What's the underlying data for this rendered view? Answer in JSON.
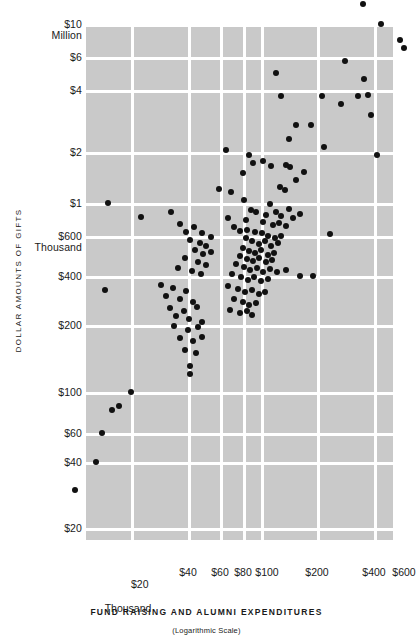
{
  "chart_data": {
    "type": "scatter",
    "title": "",
    "xlabel": "FUND RAISING AND ALUMNI EXPENDITURES",
    "ylabel": "DOLLAR AMOUNTS OF GIFTS",
    "scale_note": "(Logarithmic Scale)",
    "xscale": "log",
    "yscale": "log",
    "x_unit": "Thousand",
    "y_unit_top": "Million",
    "y_unit_mid": "Thousand",
    "xlim": [
      14000,
      650000
    ],
    "ylim": [
      16000,
      13000000
    ],
    "xticks": [
      {
        "value": 20000,
        "label": "$20"
      },
      {
        "value": 40000,
        "label": "$40"
      },
      {
        "value": 60000,
        "label": "$60"
      },
      {
        "value": 80000,
        "label": "$80"
      },
      {
        "value": 100000,
        "label": "$100"
      },
      {
        "value": 200000,
        "label": "$200"
      },
      {
        "value": 400000,
        "label": "$400"
      },
      {
        "value": 600000,
        "label": "$600"
      }
    ],
    "yticks": [
      {
        "value": 10000000,
        "label": "$10\nMillion"
      },
      {
        "value": 6000000,
        "label": "$6"
      },
      {
        "value": 4000000,
        "label": "$4"
      },
      {
        "value": 2000000,
        "label": "$2"
      },
      {
        "value": 1000000,
        "label": "$1"
      },
      {
        "value": 600000,
        "label": "$600\nThousand"
      },
      {
        "value": 400000,
        "label": "$400"
      },
      {
        "value": 200000,
        "label": "$200"
      },
      {
        "value": 100000,
        "label": "$100"
      },
      {
        "value": 60000,
        "label": "$60"
      },
      {
        "value": 40000,
        "label": "$40"
      },
      {
        "value": 20000,
        "label": "$20"
      }
    ],
    "grid": true,
    "legend": "none",
    "point_color": "#111111",
    "panel_color": "#c9c9c9",
    "gridline_color": "#ffffff",
    "n_points": 116,
    "points": [
      [
        363,
        4
      ],
      [
        381,
        24
      ],
      [
        400,
        40
      ],
      [
        404,
        48
      ],
      [
        345,
        61
      ],
      [
        364,
        79
      ],
      [
        368,
        95
      ],
      [
        358,
        96
      ],
      [
        276,
        73
      ],
      [
        281,
        96
      ],
      [
        322,
        96
      ],
      [
        341,
        104
      ],
      [
        371,
        115
      ],
      [
        296,
        125
      ],
      [
        311,
        125
      ],
      [
        289,
        139
      ],
      [
        324,
        147
      ],
      [
        226,
        150
      ],
      [
        249,
        155
      ],
      [
        253,
        163
      ],
      [
        263,
        161
      ],
      [
        271,
        166
      ],
      [
        286,
        165
      ],
      [
        290,
        167
      ],
      [
        304,
        172
      ],
      [
        377,
        155
      ],
      [
        243,
        173
      ],
      [
        296,
        180
      ],
      [
        280,
        187
      ],
      [
        219,
        189
      ],
      [
        285,
        190
      ],
      [
        108,
        203
      ],
      [
        231,
        192
      ],
      [
        244,
        200
      ],
      [
        270,
        204
      ],
      [
        251,
        210
      ],
      [
        256,
        212
      ],
      [
        266,
        215
      ],
      [
        276,
        212
      ],
      [
        281,
        216
      ],
      [
        289,
        209
      ],
      [
        293,
        218
      ],
      [
        300,
        214
      ],
      [
        171,
        212
      ],
      [
        228,
        218
      ],
      [
        246,
        220
      ],
      [
        263,
        222
      ],
      [
        273,
        225
      ],
      [
        279,
        223
      ],
      [
        286,
        226
      ],
      [
        141,
        217
      ],
      [
        180,
        224
      ],
      [
        194,
        227
      ],
      [
        234,
        227
      ],
      [
        240,
        231
      ],
      [
        247,
        230
      ],
      [
        255,
        232
      ],
      [
        262,
        233
      ],
      [
        268,
        236
      ],
      [
        275,
        238
      ],
      [
        281,
        236
      ],
      [
        330,
        234
      ],
      [
        186,
        232
      ],
      [
        202,
        233
      ],
      [
        211,
        237
      ],
      [
        246,
        238
      ],
      [
        252,
        241
      ],
      [
        259,
        244
      ],
      [
        265,
        241
      ],
      [
        271,
        246
      ],
      [
        278,
        243
      ],
      [
        190,
        240
      ],
      [
        200,
        243
      ],
      [
        206,
        246
      ],
      [
        243,
        248
      ],
      [
        249,
        251
      ],
      [
        255,
        253
      ],
      [
        261,
        250
      ],
      [
        268,
        255
      ],
      [
        274,
        253
      ],
      [
        195,
        250
      ],
      [
        203,
        254
      ],
      [
        211,
        252
      ],
      [
        240,
        256
      ],
      [
        247,
        259
      ],
      [
        253,
        261
      ],
      [
        259,
        258
      ],
      [
        266,
        262
      ],
      [
        272,
        260
      ],
      [
        185,
        258
      ],
      [
        198,
        262
      ],
      [
        206,
        265
      ],
      [
        236,
        264
      ],
      [
        244,
        267
      ],
      [
        250,
        270
      ],
      [
        257,
        268
      ],
      [
        263,
        272
      ],
      [
        270,
        269
      ],
      [
        277,
        272
      ],
      [
        286,
        270
      ],
      [
        178,
        268
      ],
      [
        192,
        271
      ],
      [
        201,
        274
      ],
      [
        232,
        274
      ],
      [
        241,
        277
      ],
      [
        248,
        280
      ],
      [
        254,
        277
      ],
      [
        261,
        281
      ],
      [
        268,
        279
      ],
      [
        300,
        276
      ],
      [
        313,
        276
      ],
      [
        105,
        290
      ],
      [
        161,
        285
      ],
      [
        173,
        288
      ],
      [
        186,
        291
      ],
      [
        228,
        286
      ],
      [
        238,
        289
      ],
      [
        245,
        292
      ],
      [
        252,
        290
      ],
      [
        259,
        294
      ],
      [
        265,
        292
      ],
      [
        166,
        296
      ],
      [
        180,
        299
      ],
      [
        193,
        302
      ],
      [
        234,
        299
      ],
      [
        243,
        302
      ],
      [
        249,
        305
      ],
      [
        256,
        303
      ],
      [
        170,
        308
      ],
      [
        184,
        311
      ],
      [
        197,
        307
      ],
      [
        230,
        310
      ],
      [
        240,
        313
      ],
      [
        247,
        311
      ],
      [
        176,
        316
      ],
      [
        189,
        319
      ],
      [
        202,
        322
      ],
      [
        252,
        315
      ],
      [
        174,
        326
      ],
      [
        188,
        330
      ],
      [
        198,
        327
      ],
      [
        180,
        338
      ],
      [
        193,
        341
      ],
      [
        202,
        337
      ],
      [
        185,
        350
      ],
      [
        196,
        353
      ],
      [
        190,
        366
      ],
      [
        190,
        374
      ],
      [
        131,
        392
      ],
      [
        119,
        406
      ],
      [
        112,
        410
      ],
      [
        102,
        433
      ],
      [
        96,
        462
      ],
      [
        75,
        490
      ]
    ],
    "points_note": "Pixel coordinates of plotted dots within the 413x640 figure."
  },
  "axes": {
    "y_title": "DOLLAR AMOUNTS OF GIFTS",
    "x_title": "FUND RAISING AND ALUMNI EXPENDITURES",
    "scale_note": "(Logarithmic Scale)",
    "x_unit_label": "Thousand"
  }
}
